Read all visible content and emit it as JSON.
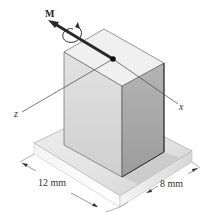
{
  "figure": {
    "moment_label": "M",
    "axis_z_label": "z",
    "axis_x_label": "x",
    "dimension_width": "12 mm",
    "dimension_depth": "8 mm"
  },
  "colors": {
    "block_top": "#efefef",
    "block_left": "#d8d8d8",
    "block_right": "#a9a9a9",
    "base_top": "#e4e4e4",
    "base_front_left": "#f2f2f2",
    "base_front_right": "#d9d9d9",
    "arrow": "#2a2a2a"
  }
}
